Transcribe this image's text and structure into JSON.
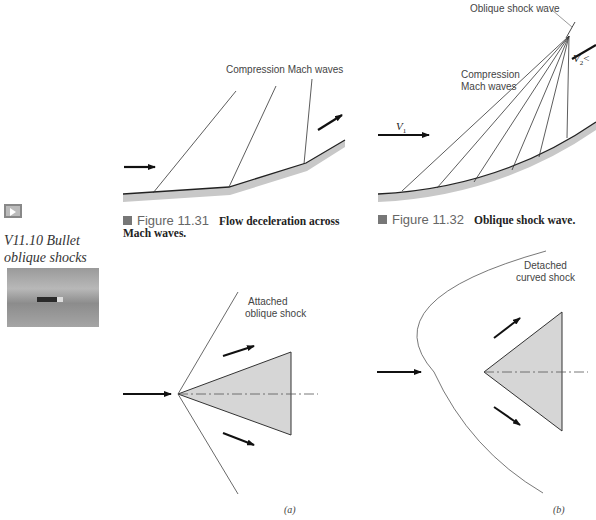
{
  "sidebar": {
    "video_icon": "play-button-icon",
    "video_title_line1": "V11.10 Bullet",
    "video_title_line2": "oblique shocks",
    "thumbnail_alt": "bullet in flight thumbnail"
  },
  "figure_11_31": {
    "label": "Compression Mach waves",
    "caption_number": "Figure 11.31",
    "caption_text_line1": "Flow deceleration across",
    "caption_text_line2": "Mach waves."
  },
  "figure_11_32": {
    "label_shock": "Oblique shock wave",
    "label_waves_line1": "Compression",
    "label_waves_line2": "Mach waves",
    "v1_label": "V",
    "v1_sub": "1",
    "v2_label": "V",
    "v2_sub": "2",
    "v2_rel": "<",
    "caption_number": "Figure 11.32",
    "caption_text": "Oblique shock wave."
  },
  "figure_wedge_a": {
    "label_line1": "Attached",
    "label_line2": "oblique shock",
    "subfig_label": "(a)"
  },
  "figure_wedge_b": {
    "label_line1": "Detached",
    "label_line2": "curved shock",
    "subfig_label": "(b)"
  },
  "colors": {
    "wall_fill": "#c8c8c8",
    "wedge_fill": "#d6d6d6",
    "line": "#333333",
    "caption_square": "#777777"
  }
}
